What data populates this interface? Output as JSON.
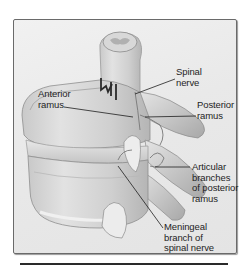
{
  "figure": {
    "colors": {
      "background": "#ffffff",
      "frame_fill": "#ececec",
      "frame_border": "#6a6a6a",
      "bone_light": "#dcdcdc",
      "bone_mid": "#bdbdbd",
      "bone_dark": "#8e8e8e",
      "leader_line": "#1e1e1e",
      "label_text": "#1e1e1e",
      "rule": "#2a2a2a"
    },
    "labels": [
      {
        "id": "spinal-nerve",
        "text": "Spinal\nnerve",
        "x": 176,
        "y": 67,
        "leader": {
          "x1": 175,
          "y1": 79,
          "x2": 135,
          "y2": 94
        }
      },
      {
        "id": "anterior-ramus",
        "text": "Anterior\nramus",
        "x": 38,
        "y": 89,
        "leader": {
          "x1": 64,
          "y1": 107,
          "x2": 133,
          "y2": 117
        }
      },
      {
        "id": "posterior-ramus",
        "text": "Posterior\nramus",
        "x": 197,
        "y": 100,
        "leader": {
          "x1": 196,
          "y1": 116,
          "x2": 145,
          "y2": 117
        }
      },
      {
        "id": "articular-branches",
        "text": "Articular\nbranches\nof posterior\nramus",
        "x": 192,
        "y": 162,
        "leader": {
          "x1": 190,
          "y1": 167,
          "x2": 155,
          "y2": 167
        }
      },
      {
        "id": "meningeal-branch",
        "text": "Meningeal\nbranch of\nspinal nerve",
        "x": 164,
        "y": 222,
        "leader": {
          "x1": 163,
          "y1": 228,
          "x2": 118,
          "y2": 166
        }
      }
    ]
  }
}
